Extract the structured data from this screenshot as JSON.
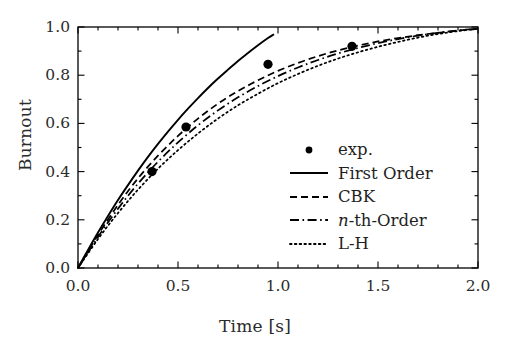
{
  "chart_data": {
    "type": "line",
    "title": "",
    "xlabel": "Time [s]",
    "ylabel": "Burnout",
    "xlim": [
      0.0,
      2.0
    ],
    "ylim": [
      0.0,
      1.0
    ],
    "xticks": [
      "0.0",
      "0.5",
      "1.0",
      "1.5",
      "2.0"
    ],
    "xtick_values": [
      0.0,
      0.5,
      1.0,
      1.5,
      2.0
    ],
    "yticks": [
      "0.0",
      "0.2",
      "0.4",
      "0.6",
      "0.8",
      "1.0"
    ],
    "ytick_values": [
      0.0,
      0.2,
      0.4,
      0.6,
      0.8,
      1.0
    ],
    "x_minor_step": 0.1,
    "y_minor_step": 0.1,
    "grid": false,
    "legend_position": "center-right-inside",
    "legend_frame": false,
    "series": [
      {
        "name": "exp.",
        "type": "scatter",
        "marker": "circle-filled",
        "color": "#000000",
        "points": [
          [
            0.37,
            0.4
          ],
          [
            0.54,
            0.585
          ],
          [
            0.95,
            0.845
          ],
          [
            1.37,
            0.92
          ]
        ]
      },
      {
        "name": "First Order",
        "type": "line",
        "linestyle": "solid",
        "color": "#000000",
        "x": [
          0.0,
          0.05,
          0.1,
          0.15,
          0.2,
          0.25,
          0.3,
          0.35,
          0.4,
          0.45,
          0.5,
          0.55,
          0.6,
          0.65,
          0.7,
          0.75,
          0.8,
          0.85,
          0.9,
          0.95,
          0.98
        ],
        "y": [
          0.0,
          0.075,
          0.147,
          0.216,
          0.282,
          0.344,
          0.404,
          0.461,
          0.515,
          0.566,
          0.615,
          0.661,
          0.705,
          0.747,
          0.786,
          0.823,
          0.859,
          0.892,
          0.924,
          0.954,
          0.97
        ]
      },
      {
        "name": "CBK",
        "type": "line",
        "linestyle": "dashed",
        "color": "#000000",
        "x": [
          0.0,
          0.1,
          0.2,
          0.3,
          0.4,
          0.5,
          0.6,
          0.7,
          0.8,
          0.9,
          1.0,
          1.1,
          1.2,
          1.3,
          1.4,
          1.5,
          1.6,
          1.7,
          1.8,
          1.9,
          2.0
        ],
        "y": [
          0.0,
          0.137,
          0.262,
          0.372,
          0.466,
          0.548,
          0.62,
          0.682,
          0.734,
          0.779,
          0.818,
          0.851,
          0.879,
          0.903,
          0.923,
          0.94,
          0.954,
          0.966,
          0.976,
          0.985,
          0.992
        ]
      },
      {
        "name": "n-th-Order",
        "type": "line",
        "linestyle": "dashdot",
        "color": "#000000",
        "x": [
          0.0,
          0.1,
          0.2,
          0.3,
          0.4,
          0.5,
          0.6,
          0.7,
          0.8,
          0.9,
          1.0,
          1.1,
          1.2,
          1.3,
          1.4,
          1.5,
          1.6,
          1.7,
          1.8,
          1.9,
          2.0
        ],
        "y": [
          0.0,
          0.129,
          0.246,
          0.35,
          0.441,
          0.521,
          0.592,
          0.654,
          0.708,
          0.755,
          0.796,
          0.832,
          0.863,
          0.89,
          0.913,
          0.933,
          0.95,
          0.964,
          0.976,
          0.986,
          0.993
        ]
      },
      {
        "name": "L-H",
        "type": "line",
        "linestyle": "dotted",
        "color": "#000000",
        "x": [
          0.0,
          0.1,
          0.2,
          0.3,
          0.4,
          0.5,
          0.6,
          0.7,
          0.8,
          0.9,
          1.0,
          1.1,
          1.2,
          1.3,
          1.4,
          1.5,
          1.6,
          1.7,
          1.8,
          1.9,
          2.0
        ],
        "y": [
          0.0,
          0.12,
          0.228,
          0.325,
          0.412,
          0.489,
          0.558,
          0.62,
          0.675,
          0.723,
          0.767,
          0.805,
          0.839,
          0.869,
          0.895,
          0.918,
          0.938,
          0.956,
          0.971,
          0.983,
          0.993
        ]
      }
    ]
  },
  "legend": {
    "entries": [
      {
        "label": "exp.",
        "style": "marker"
      },
      {
        "label": "First Order",
        "style": "solid"
      },
      {
        "label": "CBK",
        "style": "dashed"
      },
      {
        "label": "n-th-Order",
        "style": "dashdot",
        "italic_prefix": "n",
        "rest": "-th-Order"
      },
      {
        "label": "L-H",
        "style": "dotted"
      }
    ]
  }
}
